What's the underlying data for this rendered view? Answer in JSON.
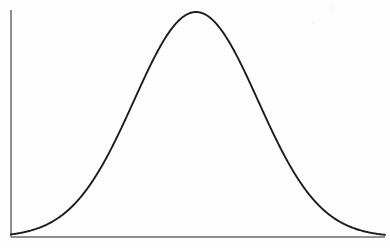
{
  "figure": {
    "background_color": "#fdfdfd",
    "curve_color": "#1c1c1c",
    "axis_color": "#8e8e8e",
    "title": "",
    "caption": ""
  },
  "chart_data": {
    "type": "line",
    "title": "",
    "subtitle": "",
    "xlabel": "",
    "ylabel": "",
    "legend": [],
    "legend_position": "none",
    "grid": false,
    "annotations": [],
    "xtick_labels": [],
    "ytick_labels": [],
    "xlim": [
      0,
      390
    ],
    "ylim": [
      0,
      226
    ],
    "distribution": {
      "name": "normal",
      "mean_px": 196,
      "sigma_px": 62,
      "peak_px": {
        "x": 196,
        "y": 12
      },
      "baseline_y_px": 237,
      "amplitude_px": 225
    },
    "axes_geometry": {
      "y_axis_x_px": 11,
      "y_axis_top_px": 10,
      "y_axis_bottom_px": 237,
      "x_axis_y_px": 237,
      "x_axis_left_px": 11,
      "x_axis_right_px": 385
    },
    "x": [
      11,
      22,
      33,
      44,
      55,
      66,
      77,
      88,
      99,
      110,
      121,
      132,
      143,
      154,
      165,
      176,
      187,
      196,
      207,
      218,
      229,
      240,
      251,
      262,
      273,
      284,
      295,
      306,
      317,
      328,
      339,
      350,
      361,
      372,
      385
    ],
    "y": [
      237,
      236,
      235,
      233,
      230,
      226,
      220,
      211,
      200,
      186,
      169,
      150,
      129,
      107,
      85,
      64,
      46,
      12,
      38,
      53,
      71,
      92,
      113,
      134,
      154,
      172,
      188,
      201,
      212,
      221,
      227,
      231,
      234,
      236,
      237
    ],
    "values_normalized": [
      0.0,
      0.004,
      0.009,
      0.018,
      0.031,
      0.049,
      0.075,
      0.115,
      0.164,
      0.226,
      0.302,
      0.387,
      0.48,
      0.578,
      0.675,
      0.769,
      0.849,
      1.0,
      0.884,
      0.818,
      0.738,
      0.644,
      0.551,
      0.458,
      0.369,
      0.289,
      0.218,
      0.16,
      0.111,
      0.071,
      0.044,
      0.027,
      0.013,
      0.004,
      0.0
    ]
  }
}
